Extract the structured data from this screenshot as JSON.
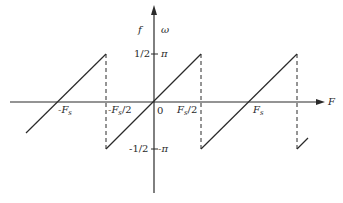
{
  "diagram": {
    "axes": {
      "horizontal_label": "F",
      "vertical_label_left": "f",
      "vertical_label_right": "ω",
      "origin_label": "0"
    },
    "x_ticks": [
      {
        "label": "-F_s",
        "text_main": "-F",
        "text_sub": "s"
      },
      {
        "label": "-F_s/2",
        "text_main": "-F",
        "text_sub": "s",
        "text_tail": "/2"
      },
      {
        "label": "F_s/2",
        "text_main": "F",
        "text_sub": "s",
        "text_tail": "/2"
      },
      {
        "label": "F_s",
        "text_main": "F",
        "text_sub": "s"
      }
    ],
    "y_ticks": {
      "top_left": "1/2",
      "top_right": "π",
      "bottom_left": "-1/2",
      "bottom_right": "-π"
    },
    "colors": {
      "line": "#2a2a2a",
      "background": "#ffffff"
    }
  }
}
